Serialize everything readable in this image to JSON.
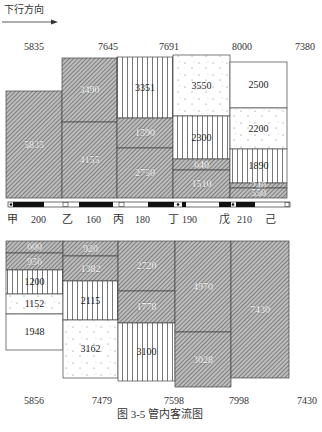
{
  "direction_label": "下行方向",
  "top_totals": [
    "5835",
    "7645",
    "7691",
    "8000",
    "7380"
  ],
  "bottom_totals": [
    "5856",
    "7479",
    "7598",
    "7998",
    "7430"
  ],
  "stations": [
    "甲",
    "乙",
    "丙",
    "丁",
    "戊",
    "己"
  ],
  "distances": [
    "200",
    "160",
    "180",
    "190",
    "210"
  ],
  "caption": "图 3-5   管内客流图",
  "footer_partial": "— 3 3 —",
  "legend_patterns": {
    "hatch": "diagonal-hatch",
    "vertical": "vertical-lines",
    "dotted": "dotted",
    "blank": "blank"
  },
  "upper_columns": [
    {
      "station": "甲",
      "blocks": [
        {
          "value": "5835",
          "pattern": "hatch"
        }
      ]
    },
    {
      "station": "乙",
      "blocks": [
        {
          "value": "3490",
          "pattern": "hatch"
        },
        {
          "value": "4155",
          "pattern": "hatch"
        }
      ]
    },
    {
      "station": "丙",
      "blocks": [
        {
          "value": "3351",
          "pattern": "vertical"
        },
        {
          "value": "1590",
          "pattern": "hatch"
        },
        {
          "value": "2750",
          "pattern": "hatch"
        }
      ]
    },
    {
      "station": "丁",
      "blocks": [
        {
          "value": "3550",
          "pattern": "dotted"
        },
        {
          "value": "2300",
          "pattern": "vertical"
        },
        {
          "value": "640",
          "pattern": "hatch"
        },
        {
          "value": "1510",
          "pattern": "hatch"
        }
      ]
    },
    {
      "station": "戊",
      "blocks": [
        {
          "value": "2500",
          "pattern": "blank"
        },
        {
          "value": "2200",
          "pattern": "dotted"
        },
        {
          "value": "1890",
          "pattern": "vertical"
        },
        {
          "value": "240",
          "pattern": "hatch"
        },
        {
          "value": "550",
          "pattern": "hatch"
        }
      ]
    }
  ],
  "lower_columns": [
    {
      "blocks": [
        {
          "value": "600",
          "pattern": "hatch"
        },
        {
          "value": "956",
          "pattern": "hatch"
        },
        {
          "value": "1200",
          "pattern": "vertical"
        },
        {
          "value": "1152",
          "pattern": "dotted"
        },
        {
          "value": "1948",
          "pattern": "blank"
        }
      ]
    },
    {
      "blocks": [
        {
          "value": "920",
          "pattern": "hatch"
        },
        {
          "value": "1382",
          "pattern": "hatch"
        },
        {
          "value": "2115",
          "pattern": "vertical"
        },
        {
          "value": "3162",
          "pattern": "dotted"
        }
      ]
    },
    {
      "blocks": [
        {
          "value": "2720",
          "pattern": "hatch"
        },
        {
          "value": "1778",
          "pattern": "hatch"
        },
        {
          "value": "3100",
          "pattern": "vertical"
        }
      ]
    },
    {
      "blocks": [
        {
          "value": "4970",
          "pattern": "hatch"
        },
        {
          "value": "3028",
          "pattern": "hatch"
        }
      ]
    },
    {
      "blocks": [
        {
          "value": "7430",
          "pattern": "hatch"
        }
      ]
    }
  ]
}
